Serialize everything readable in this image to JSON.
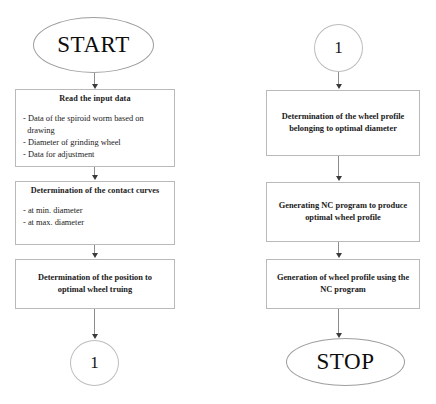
{
  "diagram": {
    "background_color": "#ffffff",
    "line_color": "#b9b9b9",
    "text_color": "#1a1a1a"
  },
  "left_column": {
    "start_terminal": {
      "label": "START"
    },
    "step_read_input": {
      "title": "Read the input data",
      "items": [
        "- Data of the spiroid worm based on",
        "  drawing",
        "- Diameter of grinding wheel",
        "- Data for adjustment"
      ]
    },
    "step_contact_curves": {
      "title": "Determination of the contact curves",
      "items": [
        "- at min. diameter",
        "- at max. diameter"
      ]
    },
    "step_position_truing": {
      "lines": [
        "Determination of the position to",
        "optimal wheel truing"
      ]
    },
    "connector_out": {
      "label": "1"
    }
  },
  "right_column": {
    "connector_in": {
      "label": "1"
    },
    "step_wheel_profile": {
      "lines": [
        "Determination of the wheel profile",
        "belonging to optimal diameter"
      ]
    },
    "step_nc_program": {
      "lines": [
        "Generating NC program to produce",
        "optimal wheel profile"
      ]
    },
    "step_generate_profile": {
      "lines": [
        "Generation of wheel profile using the",
        "NC program"
      ]
    },
    "stop_terminal": {
      "label": "STOP"
    }
  }
}
